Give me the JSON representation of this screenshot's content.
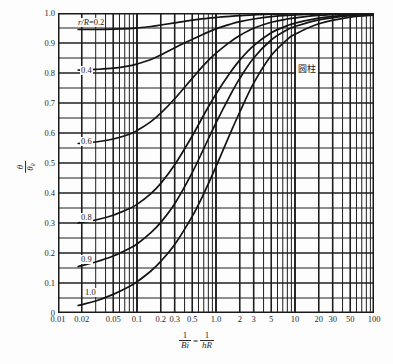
{
  "chart_data": {
    "type": "line",
    "title": "",
    "shape_annotation": "圆柱",
    "xlabel_parts": {
      "left_num": "1",
      "left_den": "Bi",
      "eq": "=",
      "right_num": "1",
      "right_den": "hR"
    },
    "ylabel_parts": {
      "num": "θ",
      "den": "θ₀"
    },
    "xscale": "log",
    "yscale": "linear",
    "xlim": [
      0.01,
      100
    ],
    "ylim": [
      0,
      1.0
    ],
    "grid": true,
    "legend_position": "inline-curve-labels",
    "xticks": [
      {
        "value": 0.01,
        "label": "0.01"
      },
      {
        "value": 0.02,
        "label": "0.02"
      },
      {
        "value": 0.05,
        "label": "0.05"
      },
      {
        "value": 0.1,
        "label": "0.1"
      },
      {
        "value": 0.2,
        "label": "0.2"
      },
      {
        "value": 0.3,
        "label": "0.3"
      },
      {
        "value": 0.5,
        "label": "0.5"
      },
      {
        "value": 1.0,
        "label": "1.0"
      },
      {
        "value": 2,
        "label": "2"
      },
      {
        "value": 3,
        "label": "3"
      },
      {
        "value": 5,
        "label": "5"
      },
      {
        "value": 10,
        "label": "10"
      },
      {
        "value": 20,
        "label": "20"
      },
      {
        "value": 30,
        "label": "30"
      },
      {
        "value": 50,
        "label": "50"
      },
      {
        "value": 100,
        "label": "100"
      }
    ],
    "yticks": [
      {
        "value": 1.0,
        "label": "1.0"
      },
      {
        "value": 0.9,
        "label": "0.9"
      },
      {
        "value": 0.8,
        "label": "0.8"
      },
      {
        "value": 0.7,
        "label": "0.7"
      },
      {
        "value": 0.6,
        "label": "0.6"
      },
      {
        "value": 0.5,
        "label": "0.5"
      },
      {
        "value": 0.4,
        "label": "0.4"
      },
      {
        "value": 0.3,
        "label": "0.3"
      },
      {
        "value": 0.2,
        "label": "0.2"
      },
      {
        "value": 0.1,
        "label": "0.1"
      },
      {
        "value": 0.0,
        "label": "0"
      }
    ],
    "series": [
      {
        "name": "r/R=0.2",
        "label": "r/R=0.2",
        "label_prefix_italic": "r/R",
        "label_value": "=0.2",
        "points": [
          [
            0.018,
            0.945
          ],
          [
            0.02,
            0.945
          ],
          [
            0.03,
            0.945
          ],
          [
            0.05,
            0.946
          ],
          [
            0.08,
            0.948
          ],
          [
            0.1,
            0.95
          ],
          [
            0.15,
            0.955
          ],
          [
            0.2,
            0.96
          ],
          [
            0.3,
            0.967
          ],
          [
            0.5,
            0.976
          ],
          [
            0.7,
            0.981
          ],
          [
            1.0,
            0.985
          ],
          [
            1.5,
            0.989
          ],
          [
            2.0,
            0.991
          ],
          [
            3.0,
            0.994
          ],
          [
            5.0,
            0.996
          ],
          [
            8.0,
            0.997
          ],
          [
            10.0,
            0.998
          ],
          [
            20.0,
            0.999
          ],
          [
            50.0,
            1.0
          ],
          [
            100.0,
            1.0
          ]
        ]
      },
      {
        "name": "r/R=0.4",
        "label": "0.4",
        "points": [
          [
            0.018,
            0.81
          ],
          [
            0.02,
            0.81
          ],
          [
            0.03,
            0.812
          ],
          [
            0.05,
            0.816
          ],
          [
            0.08,
            0.824
          ],
          [
            0.1,
            0.83
          ],
          [
            0.15,
            0.845
          ],
          [
            0.2,
            0.86
          ],
          [
            0.3,
            0.884
          ],
          [
            0.5,
            0.912
          ],
          [
            0.7,
            0.93
          ],
          [
            1.0,
            0.947
          ],
          [
            1.5,
            0.962
          ],
          [
            2.0,
            0.971
          ],
          [
            3.0,
            0.98
          ],
          [
            5.0,
            0.988
          ],
          [
            8.0,
            0.992
          ],
          [
            10.0,
            0.994
          ],
          [
            20.0,
            0.997
          ],
          [
            50.0,
            0.999
          ],
          [
            100.0,
            1.0
          ]
        ]
      },
      {
        "name": "r/R=0.6",
        "label": "0.6",
        "points": [
          [
            0.018,
            0.565
          ],
          [
            0.02,
            0.566
          ],
          [
            0.03,
            0.57
          ],
          [
            0.05,
            0.58
          ],
          [
            0.08,
            0.596
          ],
          [
            0.1,
            0.608
          ],
          [
            0.15,
            0.638
          ],
          [
            0.2,
            0.666
          ],
          [
            0.3,
            0.714
          ],
          [
            0.5,
            0.782
          ],
          [
            0.7,
            0.826
          ],
          [
            1.0,
            0.866
          ],
          [
            1.5,
            0.903
          ],
          [
            2.0,
            0.925
          ],
          [
            3.0,
            0.949
          ],
          [
            5.0,
            0.969
          ],
          [
            8.0,
            0.98
          ],
          [
            10.0,
            0.984
          ],
          [
            20.0,
            0.992
          ],
          [
            50.0,
            0.997
          ],
          [
            100.0,
            0.999
          ]
        ]
      },
      {
        "name": "r/R=0.8",
        "label": "0.8",
        "points": [
          [
            0.018,
            0.3
          ],
          [
            0.02,
            0.302
          ],
          [
            0.03,
            0.31
          ],
          [
            0.05,
            0.326
          ],
          [
            0.08,
            0.348
          ],
          [
            0.1,
            0.362
          ],
          [
            0.15,
            0.398
          ],
          [
            0.2,
            0.432
          ],
          [
            0.3,
            0.494
          ],
          [
            0.5,
            0.59
          ],
          [
            0.7,
            0.66
          ],
          [
            1.0,
            0.73
          ],
          [
            1.5,
            0.8
          ],
          [
            2.0,
            0.843
          ],
          [
            3.0,
            0.891
          ],
          [
            5.0,
            0.934
          ],
          [
            8.0,
            0.958
          ],
          [
            10.0,
            0.966
          ],
          [
            20.0,
            0.983
          ],
          [
            50.0,
            0.993
          ],
          [
            100.0,
            0.997
          ]
        ]
      },
      {
        "name": "r/R=0.9",
        "label": "0.9",
        "points": [
          [
            0.018,
            0.155
          ],
          [
            0.02,
            0.158
          ],
          [
            0.03,
            0.17
          ],
          [
            0.05,
            0.19
          ],
          [
            0.08,
            0.215
          ],
          [
            0.1,
            0.23
          ],
          [
            0.15,
            0.268
          ],
          [
            0.2,
            0.302
          ],
          [
            0.3,
            0.364
          ],
          [
            0.5,
            0.468
          ],
          [
            0.7,
            0.548
          ],
          [
            1.0,
            0.634
          ],
          [
            1.5,
            0.724
          ],
          [
            2.0,
            0.782
          ],
          [
            3.0,
            0.85
          ],
          [
            5.0,
            0.91
          ],
          [
            8.0,
            0.944
          ],
          [
            10.0,
            0.955
          ],
          [
            20.0,
            0.977
          ],
          [
            50.0,
            0.991
          ],
          [
            100.0,
            0.996
          ]
        ]
      },
      {
        "name": "r/R=1.0",
        "label": "1.0",
        "points": [
          [
            0.018,
            0.025
          ],
          [
            0.02,
            0.028
          ],
          [
            0.03,
            0.04
          ],
          [
            0.05,
            0.062
          ],
          [
            0.08,
            0.088
          ],
          [
            0.1,
            0.104
          ],
          [
            0.15,
            0.14
          ],
          [
            0.2,
            0.172
          ],
          [
            0.3,
            0.228
          ],
          [
            0.5,
            0.322
          ],
          [
            0.7,
            0.398
          ],
          [
            1.0,
            0.488
          ],
          [
            1.5,
            0.596
          ],
          [
            2.0,
            0.67
          ],
          [
            3.0,
            0.766
          ],
          [
            5.0,
            0.858
          ],
          [
            8.0,
            0.912
          ],
          [
            10.0,
            0.929
          ],
          [
            20.0,
            0.964
          ],
          [
            50.0,
            0.986
          ],
          [
            100.0,
            0.993
          ]
        ]
      }
    ],
    "curve_label_positions": [
      {
        "series": "r/R=0.2",
        "x_px": 77,
        "y_px": 18
      },
      {
        "series": "r/R=0.4",
        "x_px": 80,
        "y_px": 66
      },
      {
        "series": "r/R=0.6",
        "x_px": 80,
        "y_px": 137
      },
      {
        "series": "r/R=0.8",
        "x_px": 80,
        "y_px": 213
      },
      {
        "series": "r/R=0.9",
        "x_px": 80,
        "y_px": 255
      },
      {
        "series": "r/R=1.0",
        "x_px": 84,
        "y_px": 288
      }
    ]
  }
}
